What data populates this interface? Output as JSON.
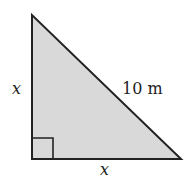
{
  "diagram": {
    "shape": "right isosceles triangle",
    "fill_color": "#d9d9d9",
    "stroke_color": "#222222",
    "labels": {
      "left_leg": "x",
      "bottom_leg": "x",
      "hypotenuse": "10 m"
    },
    "right_angle_marker": "bottom-left"
  }
}
